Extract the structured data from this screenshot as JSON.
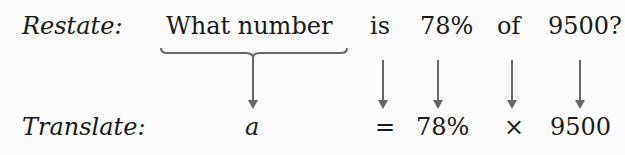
{
  "restate": {
    "label": "Restate:",
    "words": [
      "What number",
      "is",
      "78%",
      "of",
      "9500?"
    ]
  },
  "translate": {
    "label": "Translate:",
    "symbols": [
      "a",
      "=",
      "78%",
      "×",
      "9500"
    ]
  },
  "colors": {
    "text": "#1a1a1a",
    "arrow": "#666666",
    "background": "#fbfbfb"
  }
}
